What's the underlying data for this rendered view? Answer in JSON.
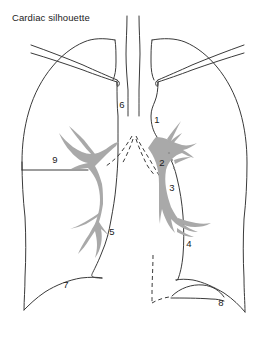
{
  "figure": {
    "title": "Cardiac silhouette",
    "kind": "anatomical line diagram",
    "background_color": "#ffffff",
    "line_color": "#3a3a3a",
    "vessel_color": "#a9a9a9",
    "text_color": "#1b1b1b"
  },
  "labels": [
    {
      "id": "1",
      "text": "1",
      "x": 157,
      "y": 123
    },
    {
      "id": "2",
      "text": "2",
      "x": 162,
      "y": 166
    },
    {
      "id": "3",
      "text": "3",
      "x": 172,
      "y": 191
    },
    {
      "id": "4",
      "text": "4",
      "x": 189,
      "y": 247
    },
    {
      "id": "5",
      "text": "5",
      "x": 112,
      "y": 235
    },
    {
      "id": "6",
      "text": "6",
      "x": 122,
      "y": 108
    },
    {
      "id": "7",
      "text": "7",
      "x": 66,
      "y": 288
    },
    {
      "id": "8",
      "text": "8",
      "x": 221,
      "y": 306
    },
    {
      "id": "9",
      "text": "9",
      "x": 55,
      "y": 163
    }
  ],
  "structures": [
    {
      "name": "trachea",
      "style": "solid-line"
    },
    {
      "name": "left-lung-outline",
      "style": "solid-line"
    },
    {
      "name": "right-lung-outline",
      "style": "solid-line"
    },
    {
      "name": "left-clavicle",
      "style": "solid-line"
    },
    {
      "name": "right-clavicle",
      "style": "solid-line"
    },
    {
      "name": "cardiac-border-right",
      "style": "solid-line"
    },
    {
      "name": "cardiac-border-left",
      "style": "solid-line"
    },
    {
      "name": "carina-dashed-v",
      "style": "dashed-line"
    },
    {
      "name": "descending-aorta-dashed",
      "style": "dashed-line"
    },
    {
      "name": "pulmonary-vasculature-right",
      "style": "gray-fill"
    },
    {
      "name": "pulmonary-vasculature-left",
      "style": "gray-fill"
    },
    {
      "name": "diaphragm-dome",
      "style": "solid-line"
    },
    {
      "name": "gastric-bubble-line",
      "style": "solid-line"
    },
    {
      "name": "label-9-leader",
      "style": "solid-line"
    }
  ]
}
